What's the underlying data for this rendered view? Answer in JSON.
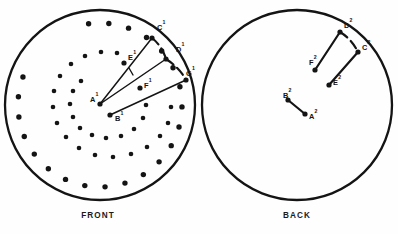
{
  "figure": {
    "background_color": "#fefefe",
    "ink_color": "#141414"
  },
  "panels": [
    {
      "id": "front",
      "caption": "FRONT",
      "caption_x": 98,
      "caption_y": 218,
      "circle": {
        "cx": 100,
        "cy": 105,
        "r": 95
      },
      "points": [
        {
          "label": "A",
          "sup": "1",
          "x": 100,
          "y": 104,
          "lx": 90,
          "ly": 102,
          "dot": true
        },
        {
          "label": "B",
          "sup": "1",
          "x": 110,
          "y": 115,
          "lx": 115,
          "ly": 121,
          "dot": true
        },
        {
          "label": "C",
          "sup": "1",
          "x": 152,
          "y": 38,
          "lx": 157,
          "ly": 30,
          "dot": true
        },
        {
          "label": "D",
          "sup": "1",
          "x": 166,
          "y": 59,
          "lx": 176,
          "ly": 52,
          "dot": true
        },
        {
          "label": "E",
          "sup": "1",
          "x": 124,
          "y": 63,
          "lx": 128,
          "ly": 60,
          "dot": true
        },
        {
          "label": "F",
          "sup": "1",
          "x": 140,
          "y": 88,
          "lx": 144,
          "ly": 88,
          "dot": true
        },
        {
          "label": "G",
          "sup": "1",
          "x": 186,
          "y": 80,
          "lx": 186,
          "ly": 76,
          "dot": true
        }
      ],
      "rays": [
        {
          "from": "A",
          "to": "C"
        },
        {
          "from": "A",
          "to": "D"
        },
        {
          "from": "B",
          "to": "G"
        }
      ],
      "dashed_arcs": [
        {
          "from": "C",
          "to": "D"
        },
        {
          "from": "D",
          "to": "G"
        }
      ],
      "tick_marks": [
        {
          "x1": 129,
          "y1": 68,
          "x2": 133,
          "y2": 75
        }
      ],
      "outer_ring": {
        "count": 22,
        "r": 82,
        "start_angle_deg": -98,
        "end_angle_deg": 200,
        "dot_r": 2.7
      },
      "spiral": {
        "description": "inward spiral of dots from outer ring toward center",
        "dot_r": 2.3,
        "dots": [
          {
            "x": 171,
            "y": 107
          },
          {
            "x": 168,
            "y": 123
          },
          {
            "x": 160,
            "y": 136
          },
          {
            "x": 147,
            "y": 147
          },
          {
            "x": 131,
            "y": 154
          },
          {
            "x": 113,
            "y": 157
          },
          {
            "x": 95,
            "y": 155
          },
          {
            "x": 79,
            "y": 148
          },
          {
            "x": 66,
            "y": 137
          },
          {
            "x": 57,
            "y": 123
          },
          {
            "x": 53,
            "y": 107
          },
          {
            "x": 54,
            "y": 91
          },
          {
            "x": 60,
            "y": 76
          },
          {
            "x": 71,
            "y": 64
          },
          {
            "x": 85,
            "y": 56
          },
          {
            "x": 101,
            "y": 52
          },
          {
            "x": 117,
            "y": 53
          },
          {
            "x": 146,
            "y": 105
          },
          {
            "x": 143,
            "y": 118
          },
          {
            "x": 134,
            "y": 129
          },
          {
            "x": 121,
            "y": 136
          },
          {
            "x": 106,
            "y": 138
          },
          {
            "x": 92,
            "y": 135
          },
          {
            "x": 80,
            "y": 128
          },
          {
            "x": 73,
            "y": 117
          },
          {
            "x": 70,
            "y": 104
          },
          {
            "x": 73,
            "y": 91
          },
          {
            "x": 81,
            "y": 81
          }
        ]
      }
    },
    {
      "id": "back",
      "caption": "BACK",
      "caption_x": 297,
      "caption_y": 218,
      "circle": {
        "cx": 297,
        "cy": 105,
        "r": 95
      },
      "points": [
        {
          "label": "A",
          "sup": "2",
          "x": 305,
          "y": 114,
          "lx": 309,
          "ly": 119,
          "dot": true
        },
        {
          "label": "B",
          "sup": "2",
          "x": 288,
          "y": 100,
          "lx": 283,
          "ly": 98,
          "dot": true
        },
        {
          "label": "C",
          "sup": "2",
          "x": 358,
          "y": 52,
          "lx": 362,
          "ly": 50,
          "dot": true
        },
        {
          "label": "D",
          "sup": "2",
          "x": 340,
          "y": 32,
          "lx": 344,
          "ly": 28,
          "dot": true
        },
        {
          "label": "E",
          "sup": "2",
          "x": 329,
          "y": 85,
          "lx": 333,
          "ly": 85,
          "dot": true
        },
        {
          "label": "F",
          "sup": "2",
          "x": 315,
          "y": 70,
          "lx": 309,
          "ly": 65,
          "dot": true
        }
      ],
      "segments": [
        {
          "from": "B",
          "to": "A"
        },
        {
          "from": "F",
          "to": "D"
        },
        {
          "from": "E",
          "to": "C"
        }
      ],
      "dashed_arcs": [
        {
          "from": "D",
          "to": "C"
        }
      ]
    }
  ]
}
